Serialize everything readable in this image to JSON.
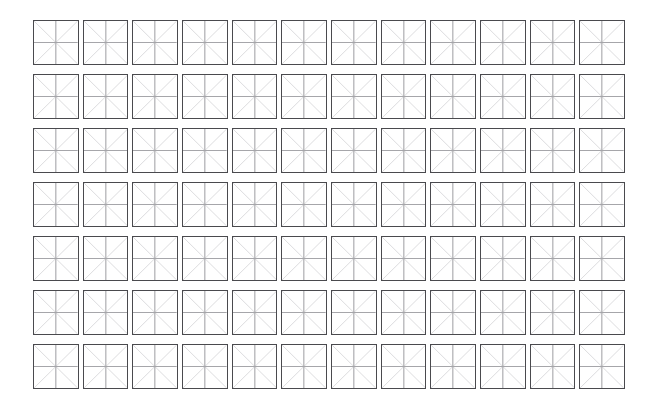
{
  "page": {
    "background_color": "#ffffff",
    "width": 655,
    "height": 415
  },
  "grid": {
    "name": "practice-grid",
    "rows": 7,
    "columns": 12,
    "total_cells": 84,
    "cell_shape": "square",
    "cell_content": "",
    "left": 33,
    "top": 20,
    "width": 592,
    "height": 369,
    "column_gap": 4,
    "row_gap": 9
  },
  "cell_style": {
    "border_color": "#4a4a4e",
    "border_width": 1.4,
    "fill_color": "#ffffff",
    "cross_guide_color": "#a6a6aa",
    "diagonal_guide_color": "#d8d8da",
    "guides": [
      "diagonal-top-left-to-bottom-right",
      "diagonal-top-right-to-bottom-left",
      "center-horizontal",
      "center-vertical"
    ]
  },
  "rows": [
    {
      "index": 1,
      "label": "row-1",
      "cells": [
        "",
        "",
        "",
        "",
        "",
        "",
        "",
        "",
        "",
        "",
        "",
        ""
      ]
    },
    {
      "index": 2,
      "label": "row-2",
      "cells": [
        "",
        "",
        "",
        "",
        "",
        "",
        "",
        "",
        "",
        "",
        "",
        ""
      ]
    },
    {
      "index": 3,
      "label": "row-3",
      "cells": [
        "",
        "",
        "",
        "",
        "",
        "",
        "",
        "",
        "",
        "",
        "",
        ""
      ]
    },
    {
      "index": 4,
      "label": "row-4",
      "cells": [
        "",
        "",
        "",
        "",
        "",
        "",
        "",
        "",
        "",
        "",
        "",
        ""
      ]
    },
    {
      "index": 5,
      "label": "row-5",
      "cells": [
        "",
        "",
        "",
        "",
        "",
        "",
        "",
        "",
        "",
        "",
        "",
        ""
      ]
    },
    {
      "index": 6,
      "label": "row-6",
      "cells": [
        "",
        "",
        "",
        "",
        "",
        "",
        "",
        "",
        "",
        "",
        "",
        ""
      ]
    },
    {
      "index": 7,
      "label": "row-7",
      "cells": [
        "",
        "",
        "",
        "",
        "",
        "",
        "",
        "",
        "",
        "",
        "",
        ""
      ]
    }
  ]
}
